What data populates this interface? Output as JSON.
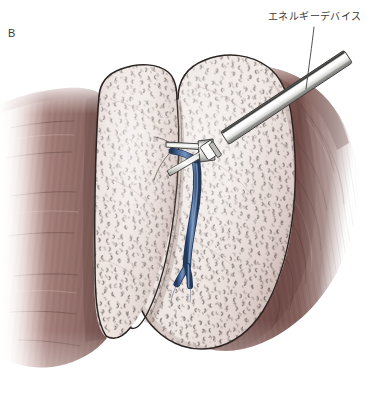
{
  "figure": {
    "panel_letter": "B",
    "background_color": "#ffffff",
    "width": 385,
    "height": 410
  },
  "annotations": [
    {
      "id": "energy-device",
      "text": "エネルギーデバイス",
      "translation_hint": "energy device",
      "x": 268,
      "y": 11,
      "leader_from": [
        314,
        27
      ],
      "leader_to": [
        306,
        89
      ],
      "color": "#3a3a3a"
    }
  ],
  "palette": {
    "page_background": "#ffffff",
    "muscle_light": "#a8837e",
    "muscle_mid": "#96716c",
    "muscle_dark": "#7d5954",
    "muscle_deep": "#6b4a46",
    "organ_base": "#e9dedb",
    "organ_light": "#f1e8e5",
    "organ_shadow": "#d3c3c0",
    "organ_outline": "#2e2624",
    "speckle": "#5d5250",
    "vessel_blue": "#3f5f8e",
    "vessel_blue_dark": "#27405f",
    "vessel_blue_light": "#7490b5",
    "instrument_light": "#f2f2f0",
    "instrument_mid": "#c9c9c7",
    "instrument_dark": "#8e8e8c",
    "instrument_edge": "#2b2b2b",
    "label_text": "#3a3a3a",
    "leader_line": "#4a4a4a"
  },
  "anatomy": {
    "left_lobe": {
      "name": "left hepatic lobe",
      "surface": "nodular cirrhotic",
      "fill": "#e9dedb"
    },
    "right_lobe": {
      "name": "right hepatic lobe",
      "surface": "nodular cirrhotic",
      "fill": "#e9dedb"
    },
    "fissure": {
      "name": "interlobar fissure",
      "description": "V-shaped cleft between lobes"
    },
    "vessel": {
      "name": "hepatic vein branch",
      "color": "#3f5f8e",
      "bifurcation_point": [
        190,
        266
      ],
      "clamped_at": [
        196,
        162
      ]
    },
    "surrounding_tissue": {
      "left": "abdominal wall muscle",
      "right": "abdominal wall muscle"
    }
  },
  "instrument": {
    "name": "energy device",
    "type": "laparoscopic sealing device",
    "shaft_start": [
      362,
      47
    ],
    "shaft_end": [
      204,
      153
    ],
    "collar_at": [
      205,
      152
    ],
    "jaw_tip": [
      170,
      178
    ],
    "shaft_color": "#c9c9c7"
  }
}
